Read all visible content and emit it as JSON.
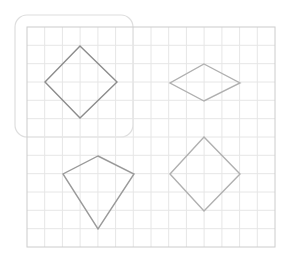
{
  "diagram": {
    "canvas": {
      "width": 283,
      "height": 265,
      "background": "#ffffff"
    },
    "selection_box": {
      "x": 15,
      "y": 15,
      "width": 118,
      "height": 122,
      "radius": 12,
      "stroke": "#dedede"
    },
    "grid": {
      "x": 27,
      "y": 27,
      "width": 248,
      "height": 220,
      "columns": 14,
      "rows": 12,
      "line_color": "#e6e6e6",
      "border_color": "#cccccc"
    },
    "shapes": [
      {
        "name": "square-diamond",
        "label": "Square (rotated)",
        "points": [
          [
            80,
            46
          ],
          [
            117,
            82
          ],
          [
            80,
            118
          ],
          [
            45,
            82
          ]
        ],
        "stroke": "#8c8c8c"
      },
      {
        "name": "rhombus",
        "label": "Rhombus",
        "points": [
          [
            204,
            64
          ],
          [
            240,
            83
          ],
          [
            204,
            101
          ],
          [
            170,
            83
          ]
        ],
        "stroke": "#b0b0b0"
      },
      {
        "name": "kite",
        "label": "Kite",
        "points": [
          [
            98,
            156
          ],
          [
            134,
            174
          ],
          [
            98,
            229
          ],
          [
            63,
            174
          ]
        ],
        "stroke": "#9a9a9a"
      },
      {
        "name": "square-diamond-2",
        "label": "Square (rotated)",
        "points": [
          [
            204,
            137
          ],
          [
            240,
            174
          ],
          [
            204,
            211
          ],
          [
            170,
            174
          ]
        ],
        "stroke": "#b0b0b0"
      }
    ]
  }
}
